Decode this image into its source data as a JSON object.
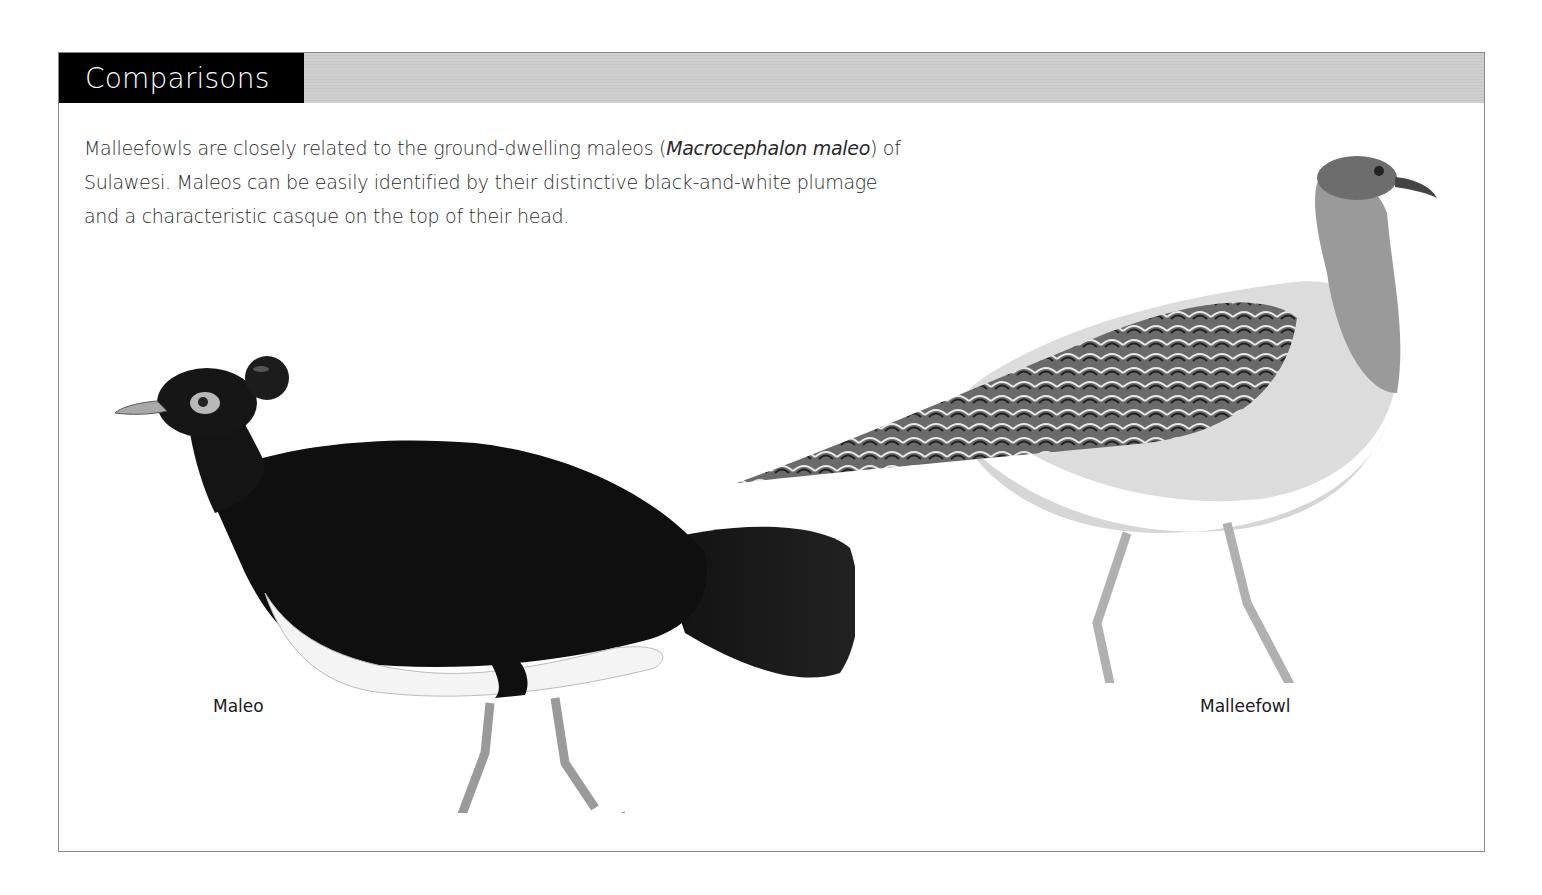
{
  "section": {
    "title": "Comparisons"
  },
  "intro": {
    "part1": "Malleefowls are closely related to the ground-dwelling maleos (",
    "scientific_name": "Macrocephalon maleo",
    "part2": ") of Sulawesi. Maleos can be easily identified by their distinctive black-and-white plumage and a characteristic casque on the top of their head."
  },
  "figures": [
    {
      "name": "maleo-illustration",
      "caption": "Maleo"
    },
    {
      "name": "malleefowl-illustration",
      "caption": "Malleefowl"
    }
  ],
  "colors": {
    "title_bg": "#000000",
    "title_text": "#ffffff",
    "header_bar": "#cccccc",
    "border": "#8a8a8a"
  }
}
